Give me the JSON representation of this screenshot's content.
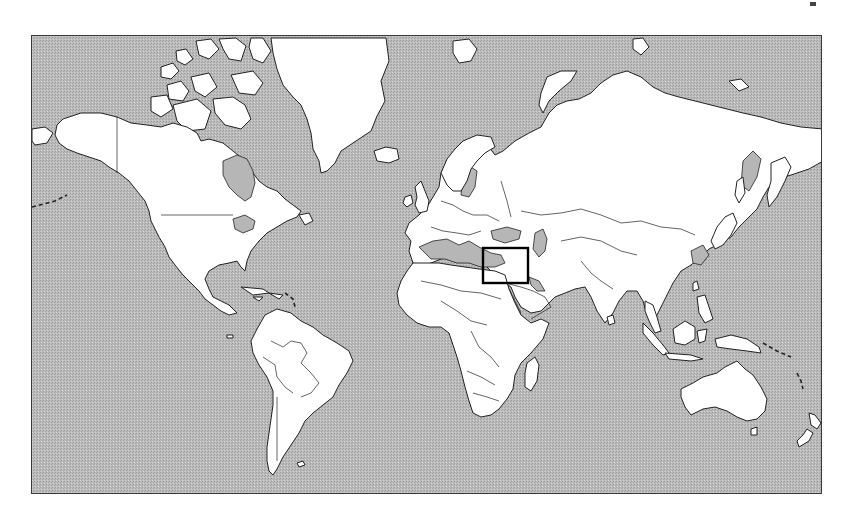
{
  "map": {
    "projection": "Mercator world map",
    "style": "grayscale outline",
    "colors": {
      "ocean": "#b6b6b6",
      "land": "#ffffff",
      "outline": "#222222",
      "highlight_box": "#000000"
    },
    "frame": {
      "x": 31,
      "y": 35,
      "width": 791,
      "height": 459
    },
    "highlight": {
      "label": "",
      "region": "Eastern Mediterranean / Levant",
      "box": {
        "x": 482,
        "y": 247,
        "width": 45,
        "height": 35
      }
    },
    "regions": [
      "North America",
      "Greenland",
      "South America",
      "Europe",
      "Africa",
      "Asia",
      "Middle East",
      "Southeast Asia",
      "Australia",
      "New Zealand"
    ]
  }
}
